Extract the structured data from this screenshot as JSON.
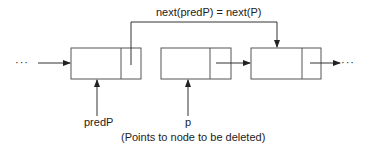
{
  "diagram": {
    "type": "linked-list-deletion",
    "top_label": "next(predP) = next(P)",
    "left_ellipsis": "···",
    "right_ellipsis": "···",
    "nodes": [
      {
        "id": "node-predP",
        "pointer_label": "predP"
      },
      {
        "id": "node-p",
        "pointer_label": "p"
      },
      {
        "id": "node-next",
        "pointer_label": ""
      }
    ],
    "caption": "(Points to node to be deleted)",
    "colors": {
      "line": "#333333",
      "box": "#555555"
    }
  }
}
